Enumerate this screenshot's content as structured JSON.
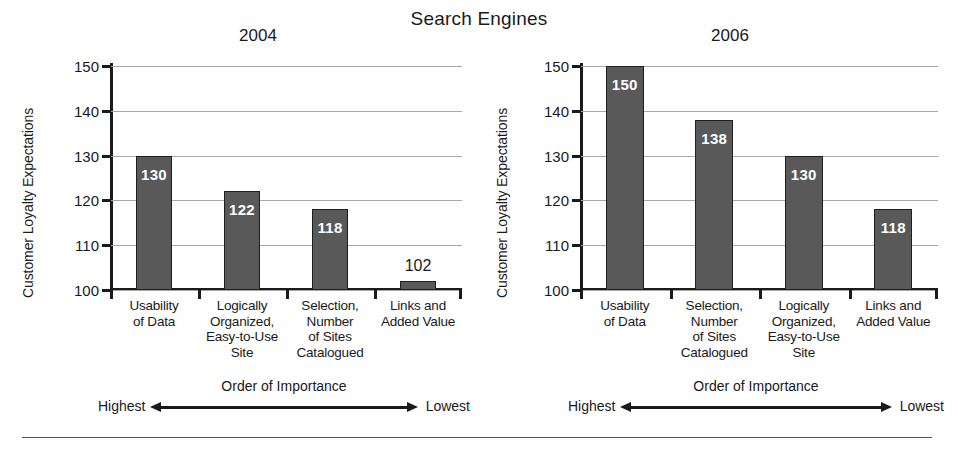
{
  "title": "Search Engines",
  "axis": {
    "y_label": "Customer Loyalty Expectations",
    "y_ticks": [
      "100",
      "110",
      "120",
      "130",
      "140",
      "150"
    ],
    "order_title": "Order of Importance",
    "order_high": "Highest",
    "order_low": "Lowest"
  },
  "colors": {
    "bar": "#595959",
    "bar_border": "#1f1f1f",
    "gridline": "#a8a8a8",
    "axis": "#1a1a1a",
    "value_inside": "#ffffff",
    "value_outside": "#1a1a1a"
  },
  "panels": [
    {
      "year": "2004"
    },
    {
      "year": "2006"
    }
  ],
  "chart_data": [
    {
      "type": "bar",
      "title": "2004",
      "xlabel": "Order of Importance",
      "ylabel": "Customer Loyalty Expectations",
      "ylim": [
        100,
        150
      ],
      "yticks": [
        100,
        110,
        120,
        130,
        140,
        150
      ],
      "grid": true,
      "legend": "none",
      "categories": [
        "Usability\nof Data",
        "Logically\nOrganized,\nEasy-to-Use\nSite",
        "Selection,\nNumber\nof Sites\nCatalogued",
        "Links and\nAdded Value"
      ],
      "category_lines": [
        [
          "Usability",
          "of Data"
        ],
        [
          "Logically",
          "Organized,",
          "Easy-to-Use",
          "Site"
        ],
        [
          "Selection,",
          "Number",
          "of Sites",
          "Catalogued"
        ],
        [
          "Links and",
          "Added Value"
        ]
      ],
      "values": [
        130,
        122,
        118,
        102
      ],
      "labels": [
        "130",
        "122",
        "118",
        "102"
      ],
      "label_placement": [
        "inside",
        "inside",
        "inside",
        "outside"
      ],
      "annotations": [
        "Highest",
        "Lowest"
      ]
    },
    {
      "type": "bar",
      "title": "2006",
      "xlabel": "Order of Importance",
      "ylabel": "Customer Loyalty Expectations",
      "ylim": [
        100,
        150
      ],
      "yticks": [
        100,
        110,
        120,
        130,
        140,
        150
      ],
      "grid": true,
      "legend": "none",
      "categories": [
        "Usability\nof Data",
        "Selection,\nNumber\nof Sites\nCatalogued",
        "Logically\nOrganized,\nEasy-to-Use\nSite",
        "Links and\nAdded Value"
      ],
      "category_lines": [
        [
          "Usability",
          "of Data"
        ],
        [
          "Selection,",
          "Number",
          "of Sites",
          "Catalogued"
        ],
        [
          "Logically",
          "Organized,",
          "Easy-to-Use",
          "Site"
        ],
        [
          "Links and",
          "Added Value"
        ]
      ],
      "values": [
        150,
        138,
        130,
        118
      ],
      "labels": [
        "150",
        "138",
        "130",
        "118"
      ],
      "label_placement": [
        "inside",
        "inside",
        "inside",
        "inside"
      ],
      "annotations": [
        "Highest",
        "Lowest"
      ]
    }
  ]
}
